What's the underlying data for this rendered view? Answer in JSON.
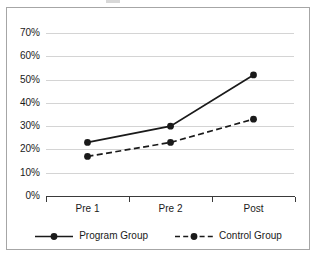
{
  "figure": {
    "background_color": "#ffffff",
    "border_color": "#a6a6a6",
    "title_remnant": ""
  },
  "chart_data": {
    "type": "line",
    "title": "",
    "xlabel": "",
    "ylabel": "",
    "categories": [
      "Pre 1",
      "Pre 2",
      "Post"
    ],
    "series": [
      {
        "name": "Program Group",
        "values": [
          23,
          30,
          52
        ],
        "line_style": "solid",
        "color": "#1a1a1a",
        "marker": "circle"
      },
      {
        "name": "Control Group",
        "values": [
          17,
          23,
          33
        ],
        "line_style": "dashed",
        "color": "#1a1a1a",
        "marker": "circle"
      }
    ],
    "ylim": [
      0,
      70
    ],
    "ytick_values": [
      0,
      10,
      20,
      30,
      40,
      50,
      60,
      70
    ],
    "ytick_labels": [
      "0%",
      "10%",
      "20%",
      "30%",
      "40%",
      "50%",
      "60%",
      "70%"
    ],
    "value_suffix": "%",
    "grid": true,
    "grid_color": "#d4d4d4",
    "legend_position": "bottom",
    "axis_color": "#3a3a3a"
  },
  "legend": {
    "entries": [
      {
        "label": "Program Group",
        "style": "solid"
      },
      {
        "label": "Control Group",
        "style": "dashed"
      }
    ]
  }
}
